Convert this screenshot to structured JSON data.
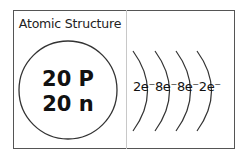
{
  "title": "Atomic Structure",
  "nucleus": {
    "protons": "20 P",
    "neutrons": "20 n"
  },
  "shells": [
    {
      "label": "2e⁻"
    },
    {
      "label": "8e⁻"
    },
    {
      "label": "8e⁻"
    },
    {
      "label": "2e⁻"
    }
  ],
  "colors": {
    "border": "#555555",
    "divider": "#c8c8c8",
    "stroke": "#333333",
    "text": "#111111"
  }
}
